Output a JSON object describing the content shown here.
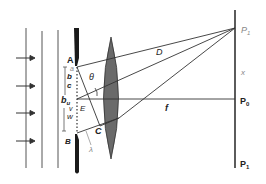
{
  "diagram": {
    "labels": {
      "A": "A",
      "a": "a",
      "b": "b",
      "c": "c",
      "bu": "b",
      "bu_sub": "u",
      "v": "v",
      "w": "w",
      "E": "E",
      "B": "B",
      "C": "C",
      "theta": "θ",
      "lambda": "λ",
      "D": "D",
      "f": "f",
      "x": "x",
      "P1_top": "P",
      "P1_top_sub": "1",
      "P0": "P",
      "P0_sub": "0",
      "P1_bottom": "P",
      "P1_bottom_sub": "1"
    },
    "elements": [
      "incoming wavefronts",
      "incident arrows",
      "slit barrier",
      "converging lens",
      "screen",
      "rays to P1",
      "central ray to P0"
    ]
  }
}
